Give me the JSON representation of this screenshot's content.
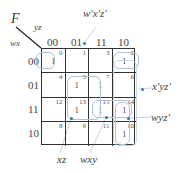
{
  "function_label": "F",
  "col_var": "yz",
  "row_var": "wx",
  "col_headers": [
    "00",
    "01",
    "11",
    "10"
  ],
  "row_headers": [
    "00",
    "01",
    "11",
    "10"
  ],
  "cells": [
    [
      {
        "m": "0",
        "v": "1"
      },
      {
        "m": "1",
        "v": ""
      },
      {
        "m": "3",
        "v": ""
      },
      {
        "m": "2",
        "v": "1"
      }
    ],
    [
      {
        "m": "4",
        "v": ""
      },
      {
        "m": "5",
        "v": "1"
      },
      {
        "m": "7",
        "v": "1"
      },
      {
        "m": "6",
        "v": ""
      }
    ],
    [
      {
        "m": "12",
        "v": ""
      },
      {
        "m": "13",
        "v": "1"
      },
      {
        "m": "15",
        "v": "1"
      },
      {
        "m": "14",
        "v": "1"
      }
    ],
    [
      {
        "m": "8",
        "v": ""
      },
      {
        "m": "9",
        "v": ""
      },
      {
        "m": "11",
        "v": ""
      },
      {
        "m": "10",
        "v": "1"
      }
    ]
  ],
  "groups": {
    "top": "w'x'z'",
    "right_upper": "x'yz'",
    "right_lower": "wyz'",
    "bottom_left": "xz",
    "bottom_mid": "wxy"
  },
  "colors": {
    "grid": "#333333",
    "loop": "#a9c4d4",
    "arrow": "#2a7ab0"
  }
}
